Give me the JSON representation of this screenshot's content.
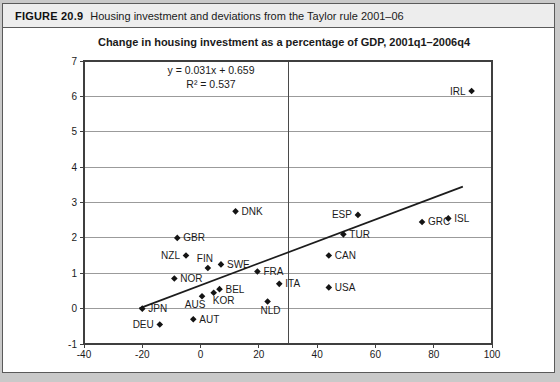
{
  "figure": {
    "label": "FIGURE 20.9",
    "caption": "Housing investment and deviations from the Taylor rule 2001–06"
  },
  "colors": {
    "marker": "#141414",
    "text": "#1a1a1a",
    "grid": "#9b9b9b",
    "frame": "#3f3f3f",
    "reference_line": "#4a4a4a",
    "trend_line": "#1c1c1c",
    "header_bg": "#ededed"
  },
  "chart_data": {
    "type": "scatter",
    "title": "Change in housing investment as a percentage of GDP, 2001q1–2006q4",
    "annotation": {
      "equation": "y = 0.031x + 0.659",
      "r_squared": "R² = 0.537"
    },
    "xlim": [
      -40,
      100
    ],
    "ylim": [
      -1,
      7
    ],
    "x_ticks": [
      -40,
      -20,
      0,
      20,
      40,
      60,
      80,
      100
    ],
    "y_ticks": [
      -1,
      0,
      1,
      2,
      3,
      4,
      5,
      6,
      7
    ],
    "grid": "horizontal",
    "legend": "none",
    "vertical_reference_line_x": 30,
    "trendline": {
      "slope": 0.031,
      "intercept": 0.659,
      "x_start": -21,
      "x_end": 90
    },
    "points": [
      {
        "label": "IRL",
        "x": 93,
        "y": 6.15,
        "label_side": "left"
      },
      {
        "label": "DNK",
        "x": 12,
        "y": 2.75,
        "label_side": "right"
      },
      {
        "label": "ESP",
        "x": 54,
        "y": 2.65,
        "label_side": "left"
      },
      {
        "label": "ISL",
        "x": 85,
        "y": 2.55,
        "label_side": "right"
      },
      {
        "label": "GRC",
        "x": 76,
        "y": 2.45,
        "label_side": "right"
      },
      {
        "label": "TUR",
        "x": 49,
        "y": 2.1,
        "label_side": "right"
      },
      {
        "label": "GBR",
        "x": -8,
        "y": 2.0,
        "label_side": "right"
      },
      {
        "label": "NZL",
        "x": -5,
        "y": 1.5,
        "label_side": "left"
      },
      {
        "label": "CAN",
        "x": 44,
        "y": 1.5,
        "label_side": "right"
      },
      {
        "label": "SWE",
        "x": 7,
        "y": 1.25,
        "label_side": "right"
      },
      {
        "label": "FIN",
        "x": 2.5,
        "y": 1.15,
        "label_side": "above"
      },
      {
        "label": "FRA",
        "x": 19.5,
        "y": 1.05,
        "label_side": "right"
      },
      {
        "label": "NOR",
        "x": -9,
        "y": 0.85,
        "label_side": "right"
      },
      {
        "label": "ITA",
        "x": 27,
        "y": 0.7,
        "label_side": "right"
      },
      {
        "label": "USA",
        "x": 44,
        "y": 0.6,
        "label_side": "right"
      },
      {
        "label": "BEL",
        "x": 6.5,
        "y": 0.55,
        "label_side": "right"
      },
      {
        "label": "KOR",
        "x": 4.5,
        "y": 0.45,
        "label_side": "below-right"
      },
      {
        "label": "AUS",
        "x": 0.5,
        "y": 0.35,
        "label_side": "below-left"
      },
      {
        "label": "NLD",
        "x": 23,
        "y": 0.2,
        "label_side": "below"
      },
      {
        "label": "JPN",
        "x": -20,
        "y": 0.0,
        "label_side": "right"
      },
      {
        "label": "AUT",
        "x": -2.5,
        "y": -0.3,
        "label_side": "right"
      },
      {
        "label": "DEU",
        "x": -14,
        "y": -0.45,
        "label_side": "left"
      }
    ]
  }
}
